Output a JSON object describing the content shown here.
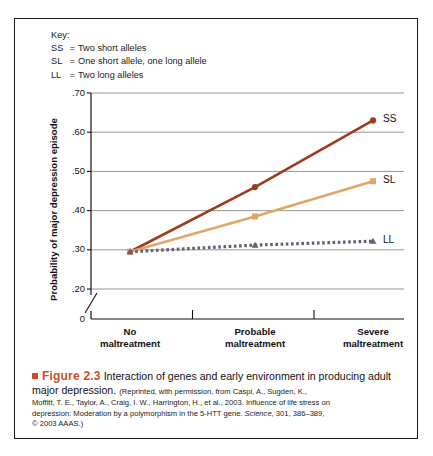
{
  "figure": {
    "key": {
      "title": "Key:",
      "entries": [
        {
          "code": "SS",
          "eq": "=",
          "desc": "Two short alleles"
        },
        {
          "code": "SL",
          "eq": "=",
          "desc": "One short allele, one long allele"
        },
        {
          "code": "LL",
          "eq": "=",
          "desc": "Two long alleles"
        }
      ]
    },
    "caption": {
      "figure_number": "Figure 2.3",
      "title": "Interaction of genes and early environment in producing adult major depression.",
      "source_line_1": "(Reprinted, with permission, from Caspi, A., Sugden, K.,",
      "source_line_2": "Moffitt, T. E., Taylor, A., Craig, I. W., Harrington, H., et al., 2003. Influence of life stress on",
      "source_line_3a": "depression: Moderation by a polymorphism in the 5-HTT gene. ",
      "source_journal": "Science,",
      "source_line_3b": " 301, 386–389,",
      "source_line_4": "© 2003 AAAS.)"
    }
  },
  "chart_data": {
    "type": "line",
    "title": "Interaction of genes and early environment in producing adult major depression",
    "xlabel": "",
    "ylabel": "Probability of major depression episode",
    "categories": [
      "No maltreatment",
      "Probable maltreatment",
      "Severe maltreatment"
    ],
    "category_lines": [
      [
        "No",
        "maltreatment"
      ],
      [
        "Probable",
        "maltreatment"
      ],
      [
        "Severe",
        "maltreatment"
      ]
    ],
    "ylim": [
      0.2,
      0.7
    ],
    "axis_break": true,
    "axis_break_label": "0",
    "ytick_labels": [
      ".70",
      ".60",
      ".50",
      ".40",
      ".30",
      ".20",
      "0"
    ],
    "ytick_values": [
      0.7,
      0.6,
      0.5,
      0.4,
      0.3,
      0.2,
      0
    ],
    "grid": true,
    "legend_position": "right-of-line-ends",
    "series": [
      {
        "name": "SS",
        "label": "SS",
        "description": "Two short alleles",
        "color": "#9e3b1c",
        "marker": "circle",
        "style": "solid",
        "values": [
          0.295,
          0.46,
          0.63
        ]
      },
      {
        "name": "SL",
        "label": "SL",
        "description": "One short allele, one long allele",
        "color": "#e0a668",
        "marker": "square",
        "style": "solid",
        "values": [
          0.295,
          0.385,
          0.475
        ]
      },
      {
        "name": "LL",
        "label": "LL",
        "description": "Two long alleles",
        "color": "#6b5a74",
        "marker": "triangle",
        "style": "dotted",
        "values": [
          0.295,
          0.312,
          0.322
        ]
      }
    ]
  }
}
